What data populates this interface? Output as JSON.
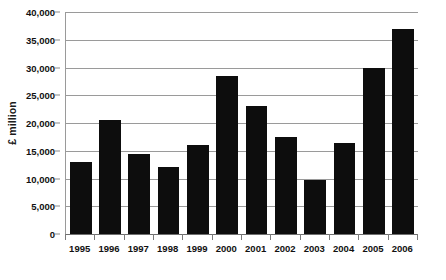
{
  "chart_data": {
    "type": "bar",
    "title": "",
    "xlabel": "",
    "ylabel": "£ million",
    "categories": [
      "1995",
      "1996",
      "1997",
      "1998",
      "1999",
      "2000",
      "2001",
      "2002",
      "2003",
      "2004",
      "2005",
      "2006"
    ],
    "values": [
      13000,
      20500,
      14500,
      12000,
      16000,
      28500,
      23000,
      17500,
      9700,
      16400,
      30000,
      37000
    ],
    "ylim": [
      0,
      40000
    ],
    "y_ticks": [
      0,
      5000,
      10000,
      15000,
      20000,
      25000,
      30000,
      35000,
      40000
    ],
    "y_tick_labels": [
      "0",
      "5,000",
      "10,000",
      "15,000",
      "20,000",
      "25,000",
      "30,000",
      "35,000",
      "40,000"
    ],
    "grid": true,
    "legend": false,
    "bar_color": "#0d0d0d",
    "gridline_color": "#9a9a9a",
    "background_color": "#ffffff"
  }
}
